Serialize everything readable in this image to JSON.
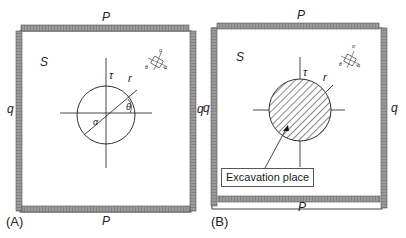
{
  "panels": [
    {
      "id": "A",
      "caption": "(A)",
      "labels": {
        "top_load": "P",
        "bottom_load": "P",
        "left_load": "q",
        "right_load": "q",
        "medium": "S",
        "tau": "τ",
        "radius": "r",
        "theta": "θ",
        "alpha": "α",
        "element_sigma_top": "σ",
        "element_sigma_right": "σ",
        "element_theta": "θ"
      },
      "circle": {
        "fill": "none",
        "hatched": false
      }
    },
    {
      "id": "B",
      "caption": "(B)",
      "labels": {
        "top_load": "P",
        "bottom_load": "P",
        "left_load": "q",
        "right_load": "q",
        "medium": "S",
        "tau": "τ",
        "radius": "r",
        "element_sigma_top": "σ",
        "element_sigma_right": "σ",
        "element_theta": "θ"
      },
      "circle": {
        "fill": "hatched",
        "hatched": true
      },
      "callout": "Excavation place"
    }
  ],
  "colors": {
    "load_bar": "#8a8a8a",
    "line": "#333333",
    "hatch": "#555555"
  }
}
